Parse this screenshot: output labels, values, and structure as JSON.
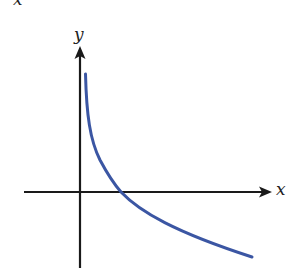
{
  "figure": {
    "top_cut_label": "x",
    "y_axis_label": "y",
    "x_axis_label": "x",
    "colors": {
      "axes": "#1a1a1a",
      "curve": "#3b56a3",
      "background": "#ffffff"
    },
    "curve_description": "decreasing logarithmic curve y = log_b(x), 0 < b < 1, crossing x-axis at x = 1"
  }
}
